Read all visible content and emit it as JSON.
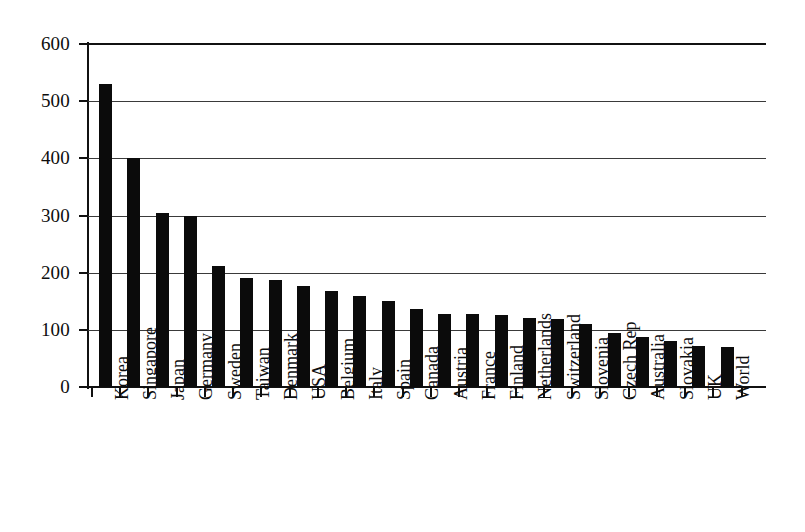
{
  "chart_data": {
    "type": "bar",
    "title": "",
    "subtitle": "",
    "xlabel": "",
    "ylabel": "",
    "ylim": [
      0,
      600
    ],
    "ytick_step": 100,
    "yticks": [
      0,
      100,
      200,
      300,
      400,
      500,
      600
    ],
    "ytick_labels": [
      "0",
      "100",
      "200",
      "300",
      "400",
      "500",
      "600"
    ],
    "grid": true,
    "grid_axis": "y",
    "legend": false,
    "legend_position": "none",
    "bar_color": "#0b0b0b",
    "categories": [
      "Korea",
      "Singapore",
      "Japan",
      "Germany",
      "Sweden",
      "Taiwan",
      "Denmark",
      "USA",
      "Belgium",
      "Italy",
      "Spain",
      "Canada",
      "Austria",
      "France",
      "Finland",
      "Netherlands",
      "Switzerland",
      "Slovenia",
      "Czech Rep",
      "Australia",
      "Slovakia",
      "UK",
      "World"
    ],
    "values": [
      530,
      400,
      305,
      300,
      212,
      190,
      188,
      176,
      168,
      160,
      150,
      137,
      128,
      127,
      126,
      120,
      119,
      110,
      95,
      88,
      80,
      72,
      70
    ]
  }
}
